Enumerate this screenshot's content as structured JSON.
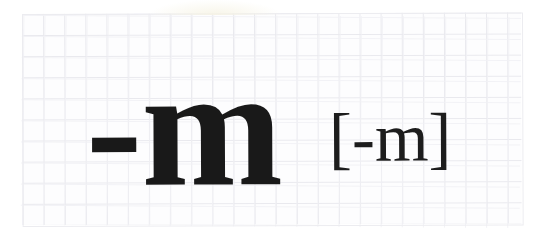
{
  "page": {
    "background_color": "#ffffff",
    "width": 542,
    "height": 243
  },
  "paper": {
    "kind": "graph-paper",
    "background_color": "#fdfdfe",
    "grid_line_color": "#e9e9ee",
    "grid_cell_px": 21,
    "region": {
      "left": 22,
      "top": 14,
      "width": 499,
      "height": 211
    }
  },
  "content": {
    "ink_color": "#191919",
    "primary_glyph": "-m",
    "bracket_glyph": "[-m]"
  }
}
